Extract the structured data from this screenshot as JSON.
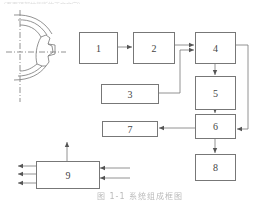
{
  "top_text": "（页面顶部被截断的正文文字）",
  "caption": "图 1-1 系统组成框图",
  "boxes": [
    {
      "id": "1",
      "label": "1"
    },
    {
      "id": "2",
      "label": "2"
    },
    {
      "id": "3",
      "label": "3"
    },
    {
      "id": "4",
      "label": "4"
    },
    {
      "id": "5",
      "label": "5"
    },
    {
      "id": "6",
      "label": "6"
    },
    {
      "id": "7",
      "label": "7"
    },
    {
      "id": "8",
      "label": "8"
    },
    {
      "id": "9",
      "label": "9"
    }
  ],
  "connections": [
    {
      "from": "1",
      "to": "2"
    },
    {
      "from": "2",
      "to": "4"
    },
    {
      "from": "3",
      "to": "4"
    },
    {
      "from": "4",
      "to": "5"
    },
    {
      "from": "5",
      "to": "6"
    },
    {
      "from": "4",
      "to": "6",
      "route": "right-side loop"
    },
    {
      "from": "6",
      "to": "7"
    },
    {
      "from": "6",
      "to": "8"
    },
    {
      "from": "9",
      "to": "out-up"
    },
    {
      "from": "9",
      "to": "out-left",
      "count": 3
    },
    {
      "from": "in-right",
      "to": "9",
      "count": 2
    }
  ],
  "colors": {
    "line": "#777777",
    "text": "#444444",
    "background": "#ffffff"
  }
}
